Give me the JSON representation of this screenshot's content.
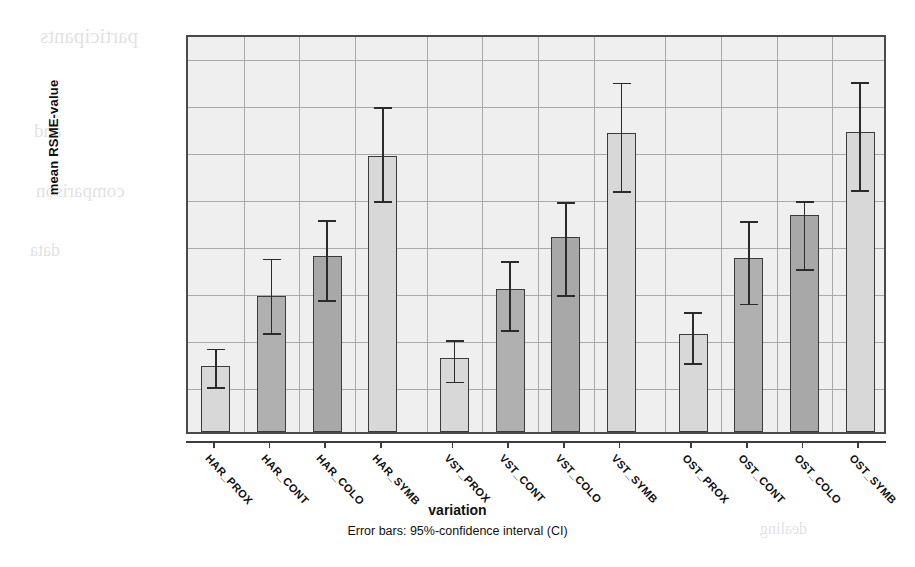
{
  "chart_data": {
    "type": "bar",
    "title": "",
    "xlabel": "variation",
    "ylabel": "mean RSME-value",
    "footnote": "Error bars: 95%-confidence interval (CI)",
    "ylim": [
      0,
      85
    ],
    "grid": true,
    "legend": "none",
    "y_numeric_ticks": [
      {
        "value": 0,
        "label": "0"
      },
      {
        "value": 20,
        "label": "20"
      },
      {
        "value": 40,
        "label": "40"
      },
      {
        "value": 60,
        "label": "60"
      },
      {
        "value": 80,
        "label": "80"
      }
    ],
    "y_verbal_ticks": [
      {
        "value": 10,
        "label": "almost no effort"
      },
      {
        "value": 26,
        "label": "a little effort"
      },
      {
        "value": 38,
        "label": "some effort"
      },
      {
        "value": 58,
        "label": "rather much effort"
      },
      {
        "value": 72,
        "label": "considerable effort"
      }
    ],
    "categories": [
      "HAR_PROX",
      "HAR_CONT",
      "HAR_COLO",
      "HAR_SYMB",
      "VST_PROX",
      "VST_CONT",
      "VST_COLO",
      "VST_SYMB",
      "OST_PROX",
      "OST_CONT",
      "OST_COLO",
      "OST_SYMB"
    ],
    "groups": [
      {
        "name": "HAR",
        "categories": [
          "HAR_PROX",
          "HAR_CONT",
          "HAR_COLO",
          "HAR_SYMB"
        ]
      },
      {
        "name": "VST",
        "categories": [
          "VST_PROX",
          "VST_CONT",
          "VST_COLO",
          "VST_SYMB"
        ]
      },
      {
        "name": "OST",
        "categories": [
          "OST_PROX",
          "OST_CONT",
          "OST_COLO",
          "OST_SYMB"
        ]
      }
    ],
    "values": [
      14.0,
      28.9,
      37.4,
      58.8,
      15.7,
      30.4,
      41.5,
      63.8,
      20.8,
      37.0,
      46.2,
      63.9
    ],
    "ci_low": [
      10.4,
      21.9,
      29.0,
      50.1,
      11.6,
      22.6,
      30.0,
      52.2,
      15.6,
      28.2,
      35.6,
      52.3
    ],
    "ci_high": [
      18.6,
      37.8,
      46.0,
      70.1,
      20.4,
      37.2,
      49.9,
      75.3,
      26.4,
      45.8,
      50.0,
      75.4
    ],
    "bar_fills": [
      "#d8d8d8",
      "#b0b0b0",
      "#a8a8a8",
      "#d8d8d8",
      "#d8d8d8",
      "#b0b0b0",
      "#a8a8a8",
      "#d8d8d8",
      "#d8d8d8",
      "#b0b0b0",
      "#a8a8a8",
      "#d8d8d8"
    ],
    "plot_background": "#efefef",
    "grid_color": "#a9a9a9",
    "axis_color": "#3c3c3c",
    "error_bar_color": "#2b2b2b"
  },
  "ghost_text": [
    {
      "text": "participants",
      "x": 40,
      "y": 24,
      "size": 21
    },
    {
      "text": "and",
      "x": 34,
      "y": 120,
      "size": 19
    },
    {
      "text": "comparison",
      "x": 36,
      "y": 180,
      "size": 19
    },
    {
      "text": "data",
      "x": 30,
      "y": 240,
      "size": 18
    },
    {
      "text": "dealing",
      "x": 760,
      "y": 520,
      "size": 16
    }
  ]
}
